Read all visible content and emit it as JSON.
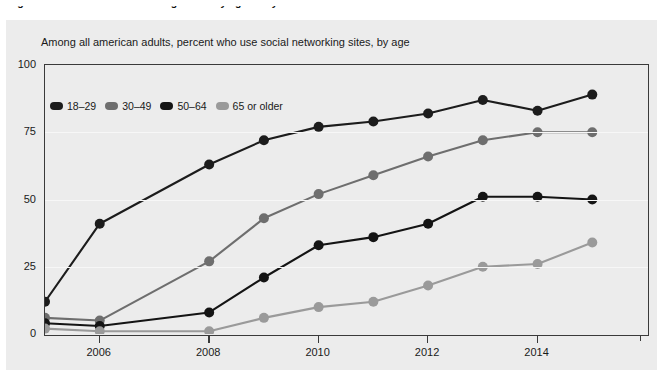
{
  "figure": {
    "caption": "Figure 1. Social media use among adults by age and year"
  },
  "chart_subtitle": "Among all american adults, percent who use social networking sites, by age",
  "legend": {
    "position": "top-left-inside",
    "items": [
      {
        "label": "18–29",
        "color": "#1c1c1c"
      },
      {
        "label": "30–49",
        "color": "#6e6e6e"
      },
      {
        "label": "50–64",
        "color": "#141414"
      },
      {
        "label": "65 or older",
        "color": "#9a9a9a"
      }
    ]
  },
  "chart_data": {
    "type": "line",
    "title": "",
    "subtitle": "Among all american adults, percent who use social networking sites, by age",
    "xlabel": "",
    "ylabel": "",
    "ylim": [
      0,
      100
    ],
    "yticks": [
      0,
      25,
      50,
      75,
      100
    ],
    "ytick_labels": [
      "0",
      "25",
      "50",
      "75",
      "100"
    ],
    "xlim": [
      2005,
      2016
    ],
    "xticks": [
      2006,
      2008,
      2010,
      2012,
      2014
    ],
    "xtick_labels": [
      "2006",
      "2008",
      "2010",
      "2012",
      "2014"
    ],
    "x": [
      2005,
      2006,
      2007,
      2008,
      2009,
      2010,
      2011,
      2012,
      2013,
      2014,
      2015,
      2016
    ],
    "grid": true,
    "legend_position": "upper left",
    "series": [
      {
        "name": "18–29",
        "color": "#1c1c1c",
        "values": [
          12,
          41,
          null,
          63,
          72,
          77,
          79,
          82,
          87,
          83,
          89,
          null
        ]
      },
      {
        "name": "30–49",
        "color": "#6e6e6e",
        "values": [
          6,
          5,
          null,
          27,
          43,
          52,
          59,
          66,
          72,
          75,
          75,
          null
        ]
      },
      {
        "name": "50–64",
        "color": "#141414",
        "values": [
          4,
          3,
          null,
          8,
          21,
          33,
          36,
          41,
          51,
          51,
          50,
          null
        ]
      },
      {
        "name": "65 or older",
        "color": "#9a9a9a",
        "values": [
          2,
          1,
          null,
          1,
          6,
          10,
          12,
          18,
          25,
          26,
          34,
          null
        ]
      }
    ]
  }
}
